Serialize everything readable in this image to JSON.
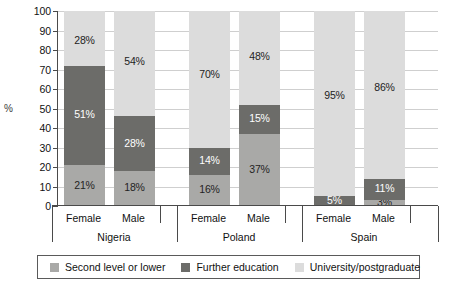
{
  "chart_data": {
    "type": "bar",
    "subtype": "stacked-column-100",
    "title": "",
    "xlabel": "",
    "ylabel": "%",
    "ylim": [
      0,
      100
    ],
    "ytick_step": 10,
    "yticks": [
      0,
      10,
      20,
      30,
      40,
      50,
      60,
      70,
      80,
      90,
      100
    ],
    "grid": true,
    "legend_position": "bottom",
    "groups": [
      "Nigeria",
      "Poland",
      "Spain"
    ],
    "categories": [
      "Female",
      "Male",
      "Female",
      "Male",
      "Female",
      "Male"
    ],
    "series": [
      {
        "name": "Second level or lower",
        "color": "#a9a9a7",
        "values": [
          21,
          18,
          16,
          37,
          0,
          3
        ],
        "labels": [
          "21%",
          "18%",
          "16%",
          "37%",
          "",
          "3%"
        ]
      },
      {
        "name": "Further education",
        "color": "#6c6c69",
        "values": [
          51,
          28,
          14,
          15,
          5,
          11
        ],
        "labels": [
          "51%",
          "28%",
          "14%",
          "15%",
          "5%",
          "11%"
        ]
      },
      {
        "name": "University/postgraduate",
        "color": "#dcdcdc",
        "values": [
          28,
          54,
          70,
          48,
          95,
          86
        ],
        "labels": [
          "28%",
          "54%",
          "70%",
          "48%",
          "95%",
          "86%"
        ]
      }
    ],
    "bars": [
      {
        "group": "Nigeria",
        "category": "Female",
        "second": 21,
        "further": 51,
        "university": 28
      },
      {
        "group": "Nigeria",
        "category": "Male",
        "second": 18,
        "further": 28,
        "university": 54
      },
      {
        "group": "Poland",
        "category": "Female",
        "second": 16,
        "further": 14,
        "university": 70
      },
      {
        "group": "Poland",
        "category": "Male",
        "second": 37,
        "further": 15,
        "university": 48
      },
      {
        "group": "Spain",
        "category": "Female",
        "second": 0,
        "further": 5,
        "university": 95
      },
      {
        "group": "Spain",
        "category": "Male",
        "second": 3,
        "further": 11,
        "university": 86
      }
    ]
  },
  "legend": {
    "items": [
      {
        "label": "Second level or lower"
      },
      {
        "label": "Further education"
      },
      {
        "label": "University/postgraduate"
      }
    ]
  }
}
